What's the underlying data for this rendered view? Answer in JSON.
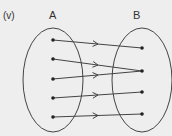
{
  "diagram": {
    "item_label": "(v)",
    "set_a": {
      "label": "A",
      "ellipse": {
        "cx": 53,
        "cy": 80,
        "rx": 30,
        "ry": 52
      },
      "points": [
        {
          "x": 53,
          "y": 40
        },
        {
          "x": 53,
          "y": 59
        },
        {
          "x": 53,
          "y": 79
        },
        {
          "x": 53,
          "y": 98
        },
        {
          "x": 53,
          "y": 117
        }
      ]
    },
    "set_b": {
      "label": "B",
      "ellipse": {
        "cx": 142,
        "cy": 80,
        "rx": 30,
        "ry": 52
      },
      "points": [
        {
          "x": 142,
          "y": 48
        },
        {
          "x": 142,
          "y": 71
        },
        {
          "x": 142,
          "y": 92
        },
        {
          "x": 142,
          "y": 114
        }
      ]
    },
    "mappings": [
      {
        "from": 0,
        "to": 0
      },
      {
        "from": 1,
        "to": 1
      },
      {
        "from": 2,
        "to": 1
      },
      {
        "from": 3,
        "to": 2
      },
      {
        "from": 4,
        "to": 3
      }
    ],
    "colors": {
      "background": "#eeeeee",
      "stroke": "#444444",
      "point": "#222222"
    }
  }
}
